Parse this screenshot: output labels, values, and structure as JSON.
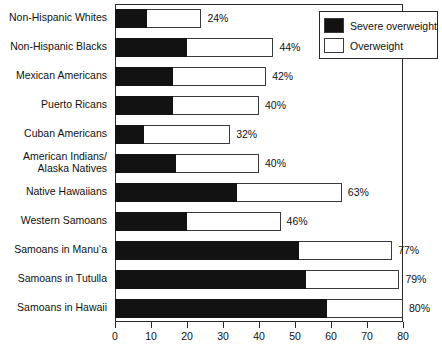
{
  "chart_data": {
    "type": "bar",
    "orientation": "horizontal",
    "stacked": true,
    "title": "",
    "subtitle": "",
    "xlabel": "",
    "ylabel": "",
    "xlim": [
      0,
      80
    ],
    "xticks": [
      0,
      10,
      20,
      30,
      40,
      50,
      60,
      70,
      80
    ],
    "xtick_labels": [
      "0",
      "10",
      "20",
      "30",
      "40",
      "50",
      "60",
      "70",
      "80"
    ],
    "grid": false,
    "legend_position": "top-right",
    "categories": [
      "Non-Hispanic Whites",
      "Non-Hispanic Blacks",
      "Mexican Americans",
      "Puerto Ricans",
      "Cuban Americans",
      "American Indians/\nAlaska Natives",
      "Native Hawaiians",
      "Western Samoans",
      "Samoans in Manu‘a",
      "Samoans in Tutulla",
      "Samoans in Hawaii"
    ],
    "series": [
      {
        "name": "Severe overweight",
        "color": "#121212",
        "values": [
          9,
          20,
          16,
          16,
          8,
          17,
          34,
          20,
          51,
          53,
          59
        ]
      },
      {
        "name": "Overweight",
        "color": "#ffffff",
        "values": [
          15,
          24,
          26,
          24,
          24,
          23,
          29,
          26,
          26,
          26,
          21
        ]
      }
    ],
    "totals": [
      24,
      44,
      42,
      40,
      32,
      40,
      63,
      46,
      77,
      79,
      80
    ],
    "data_labels": [
      "24%",
      "44%",
      "42%",
      "40%",
      "32%",
      "40%",
      "63%",
      "46%",
      "77%",
      "79%",
      "80%"
    ]
  },
  "legend": {
    "items": [
      {
        "label": "Severe overweight",
        "color": "#121212"
      },
      {
        "label": "Overweight",
        "color": "#ffffff"
      }
    ]
  }
}
